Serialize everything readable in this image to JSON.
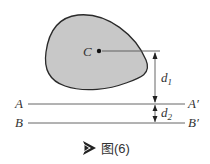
{
  "diagram": {
    "centroid_label": "C",
    "line_a": {
      "left": "A",
      "right": "A′"
    },
    "line_b": {
      "left": "B",
      "right": "B′"
    },
    "dimensions": {
      "d1": {
        "base": "d",
        "sub": "1"
      },
      "d2": {
        "base": "d",
        "sub": "2"
      }
    },
    "colors": {
      "shape_fill": "#c8c8c8",
      "shape_stroke": "#2a2a2a",
      "line": "#555555"
    }
  },
  "caption": {
    "icon": "play-arrow-icon",
    "text": "图(6)"
  }
}
